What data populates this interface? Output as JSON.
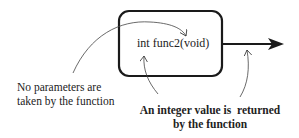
{
  "diagram": {
    "function_signature": "int func2(void)",
    "annotations": {
      "parameters_note_line1": "No parameters are",
      "parameters_note_line2": "taken by the function",
      "return_note_line1": "An integer value is  returned",
      "return_note_line2": "by the function"
    },
    "colors": {
      "stroke": "#1a1a1a",
      "text": "#222222",
      "background": "#ffffff"
    }
  }
}
